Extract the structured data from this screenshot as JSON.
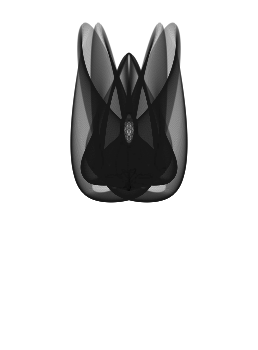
{
  "document": {
    "kind": "parametric-curve-figure",
    "title": "Harmonograph Curve",
    "background_color": "#ffffff",
    "stroke_color": "#1a1a1a",
    "width": 258,
    "height": 350
  },
  "figure": {
    "name": "butterfly-harmonograph",
    "symmetry": "vertical-mirror",
    "bounding_box": {
      "x_min": 13,
      "x_max": 245,
      "y_min": 22,
      "y_max": 336
    },
    "center": {
      "x": 129,
      "y": 175
    },
    "stroke_width": 0.32,
    "stroke_opacity": 0.78,
    "curve_count": 210,
    "samples_per_curve": 420,
    "features": {
      "upper_outer_lobe_peak_y": 23,
      "central_lobe_peak_y": 48,
      "central_eye": {
        "cx": 128,
        "cy": 130,
        "rx": 5,
        "ry": 12
      },
      "lower_left_eye": {
        "cx": 78,
        "cy": 240,
        "rx": 22,
        "ry": 38
      },
      "lower_right_eye": {
        "cx": 180,
        "cy": 240,
        "rx": 22,
        "ry": 38
      },
      "tail_bottom_y": 336
    }
  },
  "chart_data": {
    "type": "line",
    "xlabel": "",
    "ylabel": "",
    "grid": false,
    "legend": null,
    "xlim": [
      13,
      245
    ],
    "ylim": [
      22,
      336
    ],
    "parametric": {
      "model": "lissajous-family",
      "t_start": 0,
      "t_end": 6.283185307179586,
      "x_amplitude": 116,
      "y_amplitude": 157,
      "x_freq_a": 3,
      "x_freq_b": 1,
      "y_freq_a": 2,
      "y_freq_b": 4,
      "phase_start": 0,
      "phase_end": 3.141592653589793,
      "phase_steps": 210,
      "decay": 0.0
    },
    "series": [
      {
        "name": "harmonograph-family",
        "color": "#1a1a1a",
        "line_width": 0.32,
        "opacity": 0.78,
        "count": 210
      }
    ]
  }
}
